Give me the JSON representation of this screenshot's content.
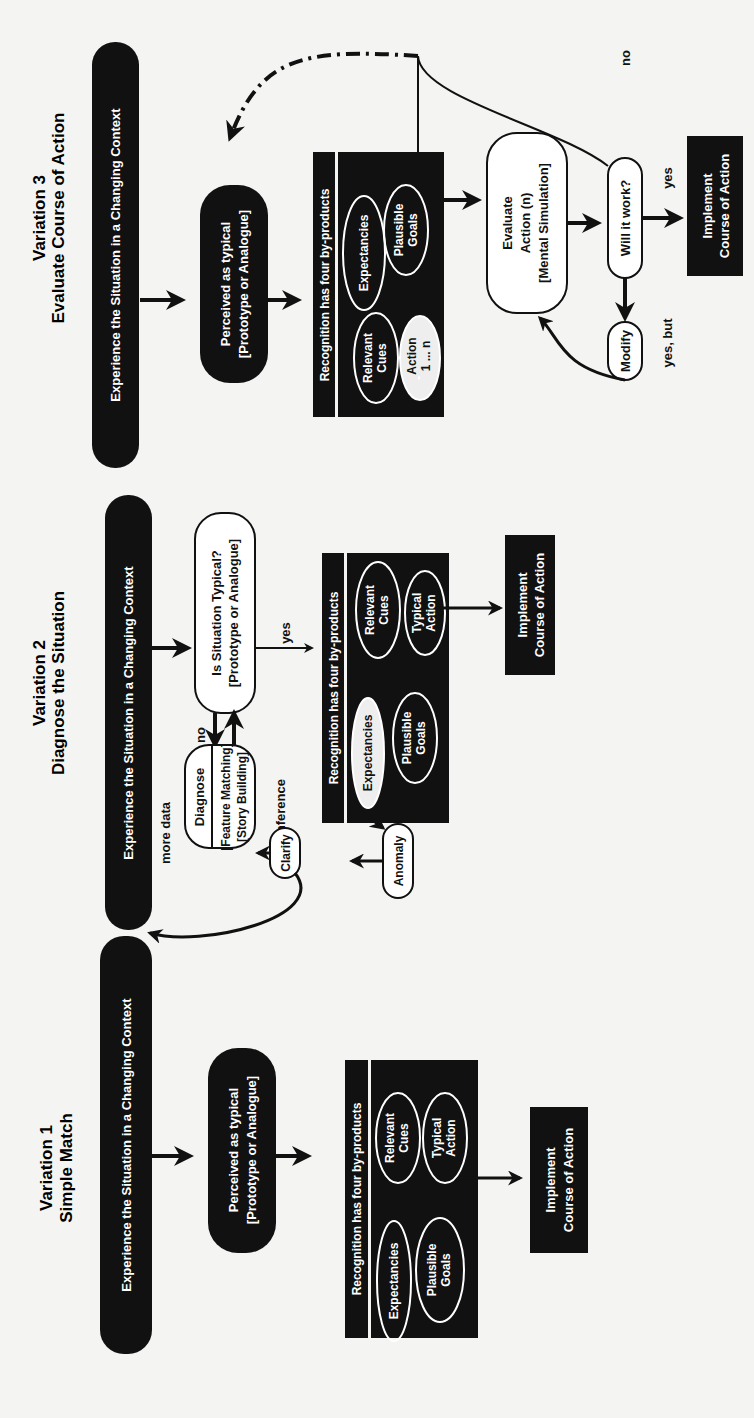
{
  "figure": {
    "orientation": "rotated-90-ccw",
    "colors": {
      "ink": "#111111",
      "paper": "#f4f4f2",
      "white": "#ffffff"
    },
    "variations": [
      {
        "id": "v1",
        "title": "Variation 1",
        "subtitle": "Simple Match",
        "experience": "Experience the Situation in a Changing Context",
        "perceived": [
          "Perceived as typical",
          "[Prototype or Analogue]"
        ],
        "recognition_header": "Recognition has four by-products",
        "byproducts": {
          "expectancies": "Expectancies",
          "relevant_cues": [
            "Relevant",
            "Cues"
          ],
          "plausible_goals": [
            "Plausible",
            "Goals"
          ],
          "action": [
            "Typical",
            "Action"
          ]
        },
        "implement": [
          "Implement",
          "Course of Action"
        ]
      },
      {
        "id": "v2",
        "title": "Variation 2",
        "subtitle": "Diagnose the Situation",
        "experience": "Experience the Situation in a Changing Context",
        "decision": [
          "Is Situation Typical?",
          "[Prototype or Analogue]"
        ],
        "diagnose": {
          "title": "Diagnose",
          "lines": [
            "[Feature Matching]",
            "[Story Building]"
          ]
        },
        "labels": {
          "yes": "yes",
          "no": "no",
          "more_data": "more data",
          "inference": "Inference"
        },
        "clarify": "Clarify",
        "anomaly": "Anomaly",
        "recognition_header": "Recognition has four by-products",
        "byproducts": {
          "expectancies": "Expectancies",
          "relevant_cues": [
            "Relevant",
            "Cues"
          ],
          "plausible_goals": [
            "Plausible",
            "Goals"
          ],
          "action": [
            "Typical",
            "Action"
          ]
        },
        "implement": [
          "Implement",
          "Course of Action"
        ]
      },
      {
        "id": "v3",
        "title": "Variation 3",
        "subtitle": "Evaluate Course of Action",
        "experience": "Experience the Situation in a Changing Context",
        "perceived": [
          "Perceived as typical",
          "[Prototype or Analogue]"
        ],
        "recognition_header": "Recognition has four by-products",
        "byproducts": {
          "expectancies": "Expectancies",
          "relevant_cues": [
            "Relevant",
            "Cues"
          ],
          "plausible_goals": [
            "Plausible",
            "Goals"
          ],
          "action": [
            "Action",
            "1 ... n"
          ]
        },
        "evaluate": [
          "Evaluate",
          "Action (n)",
          "[Mental Simulation]"
        ],
        "will_it_work": "Will it work?",
        "modify": "Modify",
        "labels": {
          "yes": "yes",
          "no": "no",
          "yes_but": "yes, but"
        },
        "implement": [
          "Implement",
          "Course of Action"
        ]
      }
    ]
  }
}
